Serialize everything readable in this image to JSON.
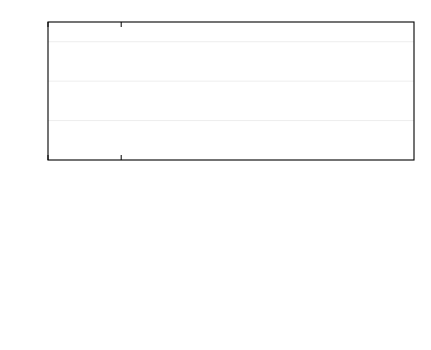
{
  "figure": {
    "background": "#ffffff",
    "axis_color": "#000000",
    "grid_color": "#e8e8e8",
    "marker_fill": "#0d0d0d"
  },
  "legend": {
    "title_lines": [
      "Glass beads"
    ],
    "param_particle_symbol": "d",
    "param_particle_sub": "p",
    "param_particle_value": "=400-600μm",
    "param_height_symbol": "H",
    "param_height_sub": "s",
    "param_height_value": "=80 mm",
    "group_label": "Bed size",
    "entries": [
      {
        "marker": "filled-circle",
        "label": "20 mm×10 mm"
      },
      {
        "marker": "open-circle",
        "label": "40 mm×10 mm"
      },
      {
        "marker": "open-square",
        "label": "80 mm×10 mm"
      }
    ]
  },
  "chart_data": [
    {
      "id": "upper",
      "type": "scatter",
      "title": "",
      "xlabel": "",
      "ylabel_symbol": "ε",
      "ylabel_sub": "s",
      "xlim": [
        0.0,
        2.5
      ],
      "ylim": [
        0.0,
        0.7
      ],
      "xticks": [
        0.0,
        0.5,
        1.0,
        1.5,
        2.0,
        2.5
      ],
      "xticklabels": [
        "",
        "0.5",
        "1.0",
        "1.5",
        "2.0",
        "2.5"
      ],
      "yticks": [
        0.0,
        0.2,
        0.4,
        0.6
      ],
      "yticklabels": [
        "0",
        "0.2",
        "0.4",
        "0.6"
      ],
      "yminorticks": [
        0.1,
        0.3,
        0.5,
        0.7
      ],
      "grid": "horizontal-light",
      "legend_position": "top-right",
      "annotations": [
        {
          "name": "eps-035-label",
          "text_symbol": "ε",
          "text_sub": "s",
          "text_value": "=0.35",
          "x": 0.13,
          "y": 0.318
        },
        {
          "name": "eps-02-label",
          "text_symbol": "ε",
          "text_sub": "s",
          "text_value": "=0.2",
          "x": 0.13,
          "y": 0.168
        }
      ],
      "guide_lines": [
        {
          "name": "eps-035-guide",
          "type": "horizontal",
          "y": 0.35,
          "x_from": 0.0,
          "x_to": 0.8
        },
        {
          "name": "eps-02-guide",
          "type": "horizontal",
          "y": 0.2,
          "x_from": 0.0,
          "x_to": 0.8
        },
        {
          "name": "uc-guide",
          "type": "vertical",
          "x": 0.8,
          "y_from": 0.0,
          "y_to": 0.35
        }
      ],
      "series": [
        {
          "name": "20 mm×10 mm",
          "marker": "filled-circle",
          "x": [
            0.31,
            0.41,
            0.5,
            0.6,
            0.7,
            0.8,
            0.9,
            1.02,
            1.12,
            1.21,
            1.31,
            1.4,
            1.5,
            1.6,
            1.81,
            2.01
          ],
          "y": [
            0.601,
            0.569,
            0.489,
            0.431,
            0.396,
            0.339,
            0.311,
            0.266,
            0.243,
            0.253,
            0.243,
            0.25,
            0.24,
            0.236,
            0.237,
            0.239
          ]
        },
        {
          "name": "40 mm×10 mm",
          "marker": "open-circle",
          "x": [
            0.31,
            0.41,
            0.5,
            0.6,
            0.7,
            0.8,
            0.9,
            1.02,
            1.12,
            1.21,
            1.31,
            1.4,
            1.5,
            1.6,
            1.81,
            2.01
          ],
          "y": [
            0.566,
            0.449,
            0.38,
            0.33,
            0.288,
            0.266,
            0.269,
            0.265,
            0.264,
            0.259,
            0.253,
            0.25,
            0.244,
            0.238,
            0.222,
            0.212
          ]
        },
        {
          "name": "80 mm×10 mm",
          "marker": "open-square",
          "x": [
            0.31,
            0.41,
            0.5,
            0.6,
            0.7,
            0.8,
            0.9,
            1.02,
            1.12,
            1.21,
            1.31,
            1.4,
            1.5,
            1.6,
            1.7,
            1.81,
            1.9,
            2.01
          ],
          "y": [
            0.425,
            0.345,
            0.281,
            0.24,
            0.216,
            0.194,
            0.177,
            0.177,
            0.173,
            0.171,
            0.168,
            0.165,
            0.168,
            0.157,
            0.159,
            0.157,
            0.155,
            0.154
          ]
        }
      ]
    },
    {
      "id": "lower",
      "type": "scatter",
      "title": "",
      "xlabel_symbol": "U",
      "xlabel_sub": "g",
      "xlabel_value": "/(m/s)",
      "ylabel_symbol": "σ",
      "ylabel_sub": "εs",
      "xlim": [
        0.0,
        2.5
      ],
      "ylim": [
        0.0,
        0.3
      ],
      "xticks": [
        0.0,
        0.5,
        1.0,
        1.5,
        2.0,
        2.5
      ],
      "xticklabels": [
        "0.0",
        "0.5",
        "1.0",
        "1.5",
        "2.0",
        "2.5"
      ],
      "yticks": [
        0.0,
        0.1,
        0.2,
        0.3
      ],
      "yticklabels": [
        "0",
        "0.1",
        "0.2",
        "0.3"
      ],
      "yminorticks": [
        0.05,
        0.15,
        0.25
      ],
      "grid": "horizontal-light",
      "annotations": [
        {
          "name": "uc-label",
          "text_symbol": "U",
          "text_sub": "c",
          "text_value": "=0.8m/s",
          "x": 0.98,
          "y": 0.064
        }
      ],
      "guide_lines": [
        {
          "name": "uc-guide",
          "type": "vertical",
          "x": 0.8,
          "y_from": 0.0,
          "y_to": 0.3
        }
      ],
      "series": [
        {
          "name": "20 mm×10 mm",
          "marker": "filled-circle",
          "x": [
            0.31,
            0.41,
            0.5,
            0.6,
            0.7,
            0.8,
            0.9,
            1.02,
            1.12,
            1.21,
            1.31,
            1.4,
            1.5,
            1.6,
            1.81,
            2.01
          ],
          "y": [
            0.003,
            0.102,
            0.195,
            0.231,
            0.249,
            0.251,
            0.244,
            0.242,
            0.235,
            0.231,
            0.217,
            0.211,
            0.186,
            0.177,
            0.156,
            0.138
          ]
        },
        {
          "name": "40 mm×10 mm",
          "marker": "open-circle",
          "x": [
            0.7,
            0.8,
            0.9,
            1.02,
            1.12,
            1.21,
            1.31,
            1.4,
            1.5,
            1.6,
            2.01
          ],
          "y": [
            0.252,
            0.257,
            0.25,
            0.246,
            0.237,
            0.232,
            0.212,
            0.209,
            0.207,
            0.196,
            0.177
          ]
        },
        {
          "name": "80 mm×10 mm",
          "marker": "open-square",
          "x": [
            0.31,
            0.41,
            0.5,
            0.6,
            0.7,
            0.76,
            0.83,
            0.9,
            1.02,
            1.12,
            1.21,
            1.31,
            1.4,
            1.46,
            1.53,
            1.6,
            1.67,
            1.81,
            1.88
          ],
          "y": [
            0.109,
            0.209,
            0.241,
            0.251,
            0.25,
            0.252,
            0.248,
            0.242,
            0.236,
            0.232,
            0.231,
            0.213,
            0.211,
            0.204,
            0.2,
            0.196,
            0.195,
            0.188,
            0.178
          ]
        }
      ]
    }
  ]
}
